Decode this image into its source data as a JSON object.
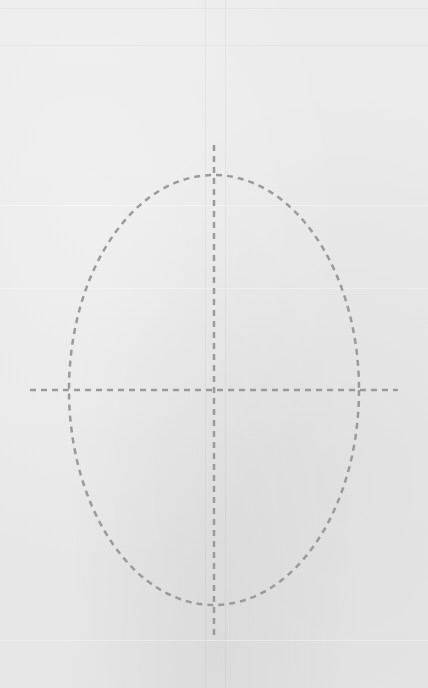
{
  "canvas": {
    "width": 428,
    "height": 688,
    "background": "#ebebeb",
    "stroke_color": "#9a9a9a"
  },
  "drawing": {
    "type": "oval-guide",
    "ellipse": {
      "cx": 214,
      "cy": 390,
      "rx": 145,
      "ry": 215
    },
    "vertical_axis": {
      "x": 214,
      "y1": 145,
      "y2": 635
    },
    "horizontal_axis": {
      "y": 390,
      "x1": 30,
      "x2": 398
    },
    "dash_pattern": "6 5",
    "stroke_width": 2.5
  }
}
